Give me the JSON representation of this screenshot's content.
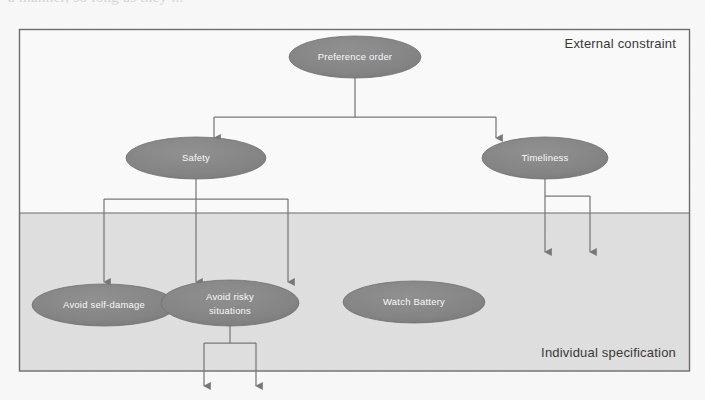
{
  "page": {
    "cutoff_top_text": "a  manner,  so  long  as  they  ...",
    "background_color": "#fdfdfd"
  },
  "diagram": {
    "type": "hierarchy-tree",
    "outer_box": {
      "border_color": "#6f6f6f",
      "fill": "#ffffff"
    },
    "regions": [
      {
        "id": "external",
        "label": "External constraint",
        "fill": "#ffffff",
        "label_color": "#3a3a3a"
      },
      {
        "id": "individual",
        "label": "Individual specification",
        "fill": "#e3e3e3",
        "label_color": "#3a3a3a"
      }
    ],
    "node_style": {
      "fill": "#858585",
      "text_color": "#ffffff",
      "stroke": "#6e6e6e"
    },
    "connector_color": "#7b7b7b",
    "nodes": [
      {
        "id": "preference-order",
        "label": "Preference order",
        "lines": [
          "Preference order"
        ],
        "region": "external"
      },
      {
        "id": "safety",
        "label": "Safety",
        "lines": [
          "Safety"
        ],
        "region": "external"
      },
      {
        "id": "timeliness",
        "label": "Timeliness",
        "lines": [
          "Timeliness"
        ],
        "region": "external"
      },
      {
        "id": "avoid-self-damage",
        "label": "Avoid self-damage",
        "lines": [
          "Avoid self-damage"
        ],
        "region": "individual"
      },
      {
        "id": "avoid-risky-situations",
        "label": "Avoid risky situations",
        "lines": [
          "Avoid risky",
          "situations"
        ],
        "region": "individual"
      },
      {
        "id": "watch-battery",
        "label": "Watch Battery",
        "lines": [
          "Watch Battery"
        ],
        "region": "individual"
      }
    ],
    "edges": [
      {
        "from": "preference-order",
        "to": "safety"
      },
      {
        "from": "preference-order",
        "to": "timeliness"
      },
      {
        "from": "safety",
        "to": "avoid-self-damage"
      },
      {
        "from": "safety",
        "to": "avoid-risky-situations"
      },
      {
        "from": "safety",
        "to": "watch-battery"
      },
      {
        "from": "timeliness",
        "to": "(unlabeled-1)"
      },
      {
        "from": "timeliness",
        "to": "(unlabeled-2)"
      },
      {
        "from": "avoid-risky-situations",
        "to": "(unlabeled-3)"
      },
      {
        "from": "avoid-risky-situations",
        "to": "(unlabeled-4)"
      }
    ],
    "dangling_arrow_count": 4
  }
}
